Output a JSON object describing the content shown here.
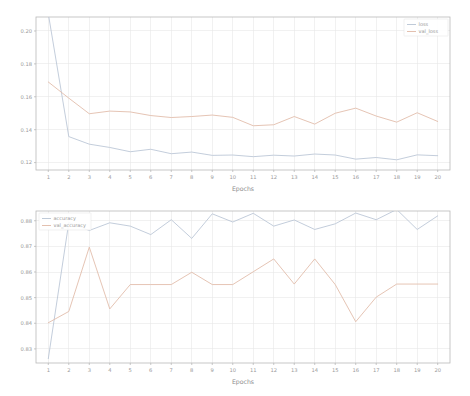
{
  "figure": {
    "background": "#ffffff",
    "width": 470,
    "height": 396
  },
  "chart_data": [
    {
      "id": "loss-chart",
      "type": "line",
      "title": "",
      "xlabel": "Epochs",
      "ylabel": "",
      "x": [
        1,
        2,
        3,
        4,
        5,
        6,
        7,
        8,
        9,
        10,
        11,
        12,
        13,
        14,
        15,
        16,
        17,
        18,
        19,
        20
      ],
      "xtick_labels": [
        "1",
        "2",
        "3",
        "4",
        "5",
        "6",
        "7",
        "8",
        "9",
        "10",
        "11",
        "12",
        "13",
        "14",
        "15",
        "16",
        "17",
        "18",
        "19",
        "20"
      ],
      "ytick_labels": [
        "0.12",
        "0.14",
        "0.16",
        "0.18",
        "0.20"
      ],
      "ytick_values": [
        0.12,
        0.14,
        0.16,
        0.18,
        0.2
      ],
      "xlim": [
        0.4,
        20.6
      ],
      "ylim": [
        0.1155,
        0.2085
      ],
      "grid": true,
      "legend_position": "upper right",
      "series": [
        {
          "name": "loss",
          "color": "#b8c4d4",
          "values": [
            0.2105,
            0.1358,
            0.1312,
            0.1292,
            0.1266,
            0.1281,
            0.1254,
            0.1264,
            0.1244,
            0.1246,
            0.1236,
            0.1245,
            0.124,
            0.1252,
            0.1246,
            0.1221,
            0.1231,
            0.1217,
            0.1247,
            0.1242
          ]
        },
        {
          "name": "val_loss",
          "color": "#e0b9a6",
          "values": [
            0.169,
            0.1592,
            0.1497,
            0.1513,
            0.1508,
            0.1486,
            0.1474,
            0.148,
            0.1489,
            0.1475,
            0.1424,
            0.143,
            0.148,
            0.1434,
            0.15,
            0.1531,
            0.1483,
            0.1446,
            0.1503,
            0.145
          ]
        }
      ]
    },
    {
      "id": "accuracy-chart",
      "type": "line",
      "title": "",
      "xlabel": "Epochs",
      "ylabel": "",
      "x": [
        1,
        2,
        3,
        4,
        5,
        6,
        7,
        8,
        9,
        10,
        11,
        12,
        13,
        14,
        15,
        16,
        17,
        18,
        19,
        20
      ],
      "xtick_labels": [
        "1",
        "2",
        "3",
        "4",
        "5",
        "6",
        "7",
        "8",
        "9",
        "10",
        "11",
        "12",
        "13",
        "14",
        "15",
        "16",
        "17",
        "18",
        "19",
        "20"
      ],
      "ytick_labels": [
        "0.83",
        "0.84",
        "0.85",
        "0.86",
        "0.87",
        "0.88"
      ],
      "ytick_values": [
        0.83,
        0.84,
        0.85,
        0.86,
        0.87,
        0.88
      ],
      "xlim": [
        0.4,
        20.6
      ],
      "ylim": [
        0.8245,
        0.8838
      ],
      "grid": true,
      "legend_position": "upper left",
      "series": [
        {
          "name": "accuracy",
          "color": "#b8c4d4",
          "values": [
            0.8262,
            0.8793,
            0.8762,
            0.8792,
            0.8779,
            0.8746,
            0.8804,
            0.8731,
            0.8827,
            0.8795,
            0.8829,
            0.8779,
            0.8803,
            0.8766,
            0.8788,
            0.883,
            0.8804,
            0.8844,
            0.8766,
            0.8819
          ]
        },
        {
          "name": "val_accuracy",
          "color": "#e0b9a6",
          "values": [
            0.8402,
            0.8446,
            0.8697,
            0.8456,
            0.8551,
            0.8551,
            0.8551,
            0.8599,
            0.8551,
            0.8551,
            0.8601,
            0.8651,
            0.8553,
            0.8651,
            0.8551,
            0.8406,
            0.8502,
            0.8553,
            0.8553,
            0.8553
          ]
        }
      ]
    }
  ]
}
